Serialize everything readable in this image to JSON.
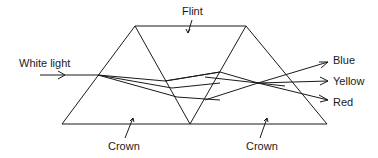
{
  "labels": {
    "input": "White light",
    "flint": "Flint",
    "crown_left": "Crown",
    "crown_right": "Crown",
    "out_blue": "Blue",
    "out_yellow": "Yellow",
    "out_red": "Red"
  },
  "colors": {
    "stroke": "#1a1a1a",
    "background": "#ffffff"
  }
}
